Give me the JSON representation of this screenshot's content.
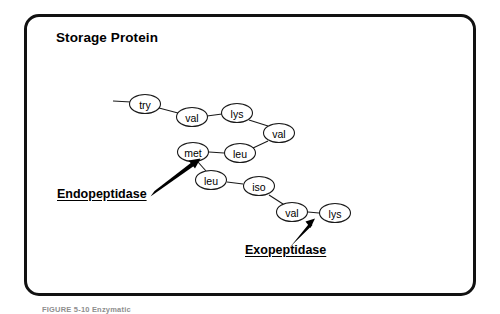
{
  "figure": {
    "title": "Storage Protein",
    "caption": "FIGURE 5-10   Enzymatic",
    "frame_color": "#111111",
    "background_color": "#ffffff"
  },
  "chain_data": {
    "type": "diagram",
    "description": "Peptide chain of a storage protein shown as linked amino acid residues, with cleavage sites marked by enzyme arrows.",
    "residues": [
      {
        "id": "try",
        "label": "try",
        "cx": 145,
        "cy": 104
      },
      {
        "id": "val1",
        "label": "val",
        "cx": 192,
        "cy": 117
      },
      {
        "id": "lys1",
        "label": "lys",
        "cx": 237,
        "cy": 113
      },
      {
        "id": "val2",
        "label": "val",
        "cx": 279,
        "cy": 133
      },
      {
        "id": "leu1",
        "label": "leu",
        "cx": 240,
        "cy": 153
      },
      {
        "id": "met",
        "label": "met",
        "cx": 193,
        "cy": 152
      },
      {
        "id": "leu2",
        "label": "leu",
        "cx": 211,
        "cy": 180
      },
      {
        "id": "iso",
        "label": "iso",
        "cx": 259,
        "cy": 186
      },
      {
        "id": "val3",
        "label": "val",
        "cx": 292,
        "cy": 212
      },
      {
        "id": "lys2",
        "label": "lys",
        "cx": 335,
        "cy": 213
      }
    ],
    "bonds": [
      {
        "from": "tail",
        "to": "try"
      },
      {
        "from": "try",
        "to": "val1"
      },
      {
        "from": "val1",
        "to": "lys1"
      },
      {
        "from": "lys1",
        "to": "val2"
      },
      {
        "from": "val2",
        "to": "leu1"
      },
      {
        "from": "leu1",
        "to": "met"
      },
      {
        "from": "met",
        "to": "leu2"
      },
      {
        "from": "leu2",
        "to": "iso"
      },
      {
        "from": "iso",
        "to": "val3"
      },
      {
        "from": "val3",
        "to": "lys2"
      }
    ],
    "node_rx": 15.5,
    "node_ry": 9.5
  },
  "enzymes": [
    {
      "id": "endopeptidase",
      "label": "Endopeptidase",
      "target_bond": "met-leu2",
      "arrow_tail": {
        "x": 152,
        "y": 194
      },
      "arrow_tip": {
        "x": 200,
        "y": 160
      }
    },
    {
      "id": "exopeptidase",
      "label": "Exopeptidase",
      "target_bond": "val3-lys2",
      "arrow_tail": {
        "x": 291,
        "y": 246
      },
      "arrow_tip": {
        "x": 314,
        "y": 219
      }
    }
  ]
}
